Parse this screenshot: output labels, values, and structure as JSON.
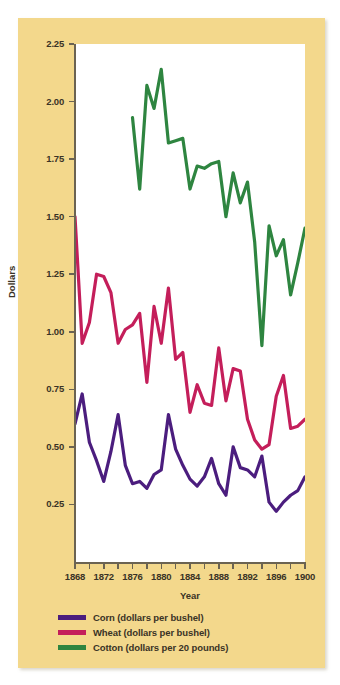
{
  "chart_data": {
    "type": "line",
    "title": "",
    "xlabel": "Year",
    "ylabel": "Dollars",
    "xlim": [
      1868,
      1900
    ],
    "ylim": [
      0,
      2.25
    ],
    "grid": false,
    "legend_position": "bottom-left",
    "x_tick_labels": [
      "1868",
      "1872",
      "1876",
      "1880",
      "1884",
      "1888",
      "1892",
      "1896",
      "1900"
    ],
    "x_tick_values": [
      1868,
      1872,
      1876,
      1880,
      1884,
      1888,
      1892,
      1896,
      1900
    ],
    "x_minor_ticks": [
      1870,
      1874,
      1878,
      1882,
      1886,
      1890,
      1894,
      1898
    ],
    "y_tick_labels": [
      "0.25",
      "0.50",
      "0.75",
      "1.00",
      "1.25",
      "1.50",
      "1.75",
      "2.00",
      "2.25"
    ],
    "y_tick_values": [
      0.25,
      0.5,
      0.75,
      1.0,
      1.25,
      1.5,
      1.75,
      2.0,
      2.25
    ],
    "colors": {
      "corn": "#4B1D7E",
      "wheat": "#C41E5A",
      "cotton": "#2E8540",
      "panel_background": "#f3d88c",
      "plot_background": "#ffffff",
      "axis": "#6b6352",
      "text": "#3a3326"
    },
    "series": [
      {
        "name": "Corn (dollars per bushel)",
        "color": "#4B1D7E",
        "x": [
          1868,
          1869,
          1870,
          1871,
          1872,
          1873,
          1874,
          1875,
          1876,
          1877,
          1878,
          1879,
          1880,
          1881,
          1882,
          1883,
          1884,
          1885,
          1886,
          1887,
          1888,
          1889,
          1890,
          1891,
          1892,
          1893,
          1894,
          1895,
          1896,
          1897,
          1898,
          1899,
          1900
        ],
        "values": [
          0.6,
          0.73,
          0.52,
          0.44,
          0.35,
          0.48,
          0.64,
          0.42,
          0.34,
          0.35,
          0.32,
          0.38,
          0.4,
          0.64,
          0.49,
          0.42,
          0.36,
          0.33,
          0.37,
          0.45,
          0.34,
          0.29,
          0.5,
          0.41,
          0.4,
          0.37,
          0.46,
          0.26,
          0.22,
          0.26,
          0.29,
          0.31,
          0.37
        ]
      },
      {
        "name": "Wheat (dollars per bushel)",
        "color": "#C41E5A",
        "x": [
          1868,
          1869,
          1870,
          1871,
          1872,
          1873,
          1874,
          1875,
          1876,
          1877,
          1878,
          1879,
          1880,
          1881,
          1882,
          1883,
          1884,
          1885,
          1886,
          1887,
          1888,
          1889,
          1890,
          1891,
          1892,
          1893,
          1894,
          1895,
          1896,
          1897,
          1898,
          1899,
          1900
        ],
        "values": [
          1.5,
          0.95,
          1.04,
          1.25,
          1.24,
          1.17,
          0.95,
          1.01,
          1.03,
          1.08,
          0.78,
          1.11,
          0.95,
          1.19,
          0.88,
          0.91,
          0.65,
          0.77,
          0.69,
          0.68,
          0.93,
          0.7,
          0.84,
          0.83,
          0.62,
          0.53,
          0.49,
          0.51,
          0.72,
          0.81,
          0.58,
          0.59,
          0.62
        ]
      },
      {
        "name": "Cotton (dollars per 20 pounds)",
        "color": "#2E8540",
        "x": [
          1876,
          1877,
          1878,
          1879,
          1880,
          1881,
          1882,
          1883,
          1884,
          1885,
          1886,
          1887,
          1888,
          1889,
          1890,
          1891,
          1892,
          1893,
          1894,
          1895,
          1896,
          1897,
          1898,
          1899,
          1900
        ],
        "values": [
          1.93,
          1.62,
          2.07,
          1.97,
          2.14,
          1.82,
          1.83,
          1.84,
          1.62,
          1.72,
          1.71,
          1.73,
          1.74,
          1.5,
          1.69,
          1.56,
          1.65,
          1.39,
          0.94,
          1.46,
          1.33,
          1.4,
          1.16,
          1.3,
          1.45
        ]
      }
    ]
  },
  "legend": {
    "items": [
      {
        "label": "Corn (dollars per bushel)",
        "color": "#4B1D7E"
      },
      {
        "label": "Wheat (dollars per bushel)",
        "color": "#C41E5A"
      },
      {
        "label": "Cotton (dollars per 20 pounds)",
        "color": "#2E8540"
      }
    ]
  }
}
